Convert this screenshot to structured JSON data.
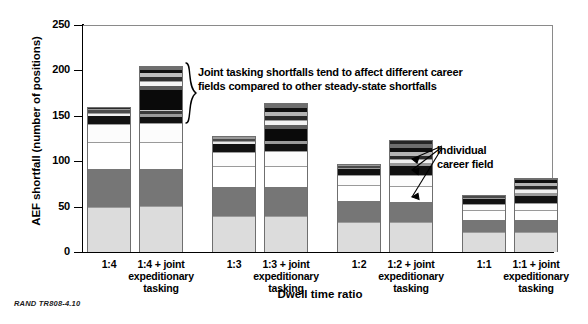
{
  "figure": {
    "footnote": "RAND TR808-4.10",
    "y_axis_title": "AEF shortfall (number of positions)",
    "x_axis_title": "Dwell time ratio"
  },
  "annotations": [
    {
      "name": "joint-tasking-note",
      "line1": "Joint tasking shortfalls tend to affect different career",
      "line2": "fields compared to other steady-state shortfalls"
    },
    {
      "name": "individual-career-field-note",
      "line1": "Individual",
      "line2": "career field"
    }
  ],
  "chart_data": {
    "type": "bar",
    "subtype": "stacked",
    "title": "",
    "xlabel": "Dwell time ratio",
    "ylabel": "AEF shortfall (number of positions)",
    "ylim": [
      0,
      250
    ],
    "yticks": [
      0,
      50,
      100,
      150,
      200,
      250
    ],
    "grid": false,
    "legend": "none",
    "categories": [
      "1:4",
      "1:4 + joint expeditionary tasking",
      "1:3",
      "1:3 + joint expeditionary tasking",
      "1:2",
      "1:2 + joint expeditionary tasking",
      "1:1",
      "1:1 + joint expeditionary tasking"
    ],
    "totals": [
      160,
      205,
      128,
      164,
      97,
      123,
      63,
      82
    ],
    "stacks": [
      {
        "category": "1:4",
        "total": 160,
        "segments": [
          {
            "value": 50,
            "color": "#dcdcdc"
          },
          {
            "value": 41,
            "color": "#767676"
          },
          {
            "value": 30,
            "color": "#ffffff"
          },
          {
            "value": 20,
            "color": "#fcfcfc"
          },
          {
            "value": 9,
            "color": "#111111"
          },
          {
            "value": 3,
            "color": "#f0f0f0"
          },
          {
            "value": 3,
            "color": "#4a4a4a"
          },
          {
            "value": 2,
            "color": "#9a9a9a"
          },
          {
            "value": 2,
            "color": "#2b2b2b"
          }
        ]
      },
      {
        "category": "1:4 + joint expeditionary tasking",
        "total": 205,
        "segments": [
          {
            "value": 51,
            "color": "#dcdcdc"
          },
          {
            "value": 40,
            "color": "#767676"
          },
          {
            "value": 30,
            "color": "#ffffff"
          },
          {
            "value": 21,
            "color": "#fcfcfc"
          },
          {
            "value": 7,
            "color": "#111111"
          },
          {
            "value": 3,
            "color": "#9a9a9a"
          },
          {
            "value": 3,
            "color": "#3a3a3a"
          },
          {
            "value": 2,
            "color": "#c8c8c8"
          },
          {
            "value": 22,
            "color": "#0a0a0a"
          },
          {
            "value": 4,
            "color": "#5a5a5a"
          },
          {
            "value": 5,
            "color": "#f4f4f4"
          },
          {
            "value": 5,
            "color": "#2f2f2f"
          },
          {
            "value": 4,
            "color": "#bdbdbd"
          },
          {
            "value": 4,
            "color": "#101010"
          },
          {
            "value": 4,
            "color": "#6e6e6e"
          }
        ]
      },
      {
        "category": "1:3",
        "total": 128,
        "segments": [
          {
            "value": 40,
            "color": "#dcdcdc"
          },
          {
            "value": 32,
            "color": "#767676"
          },
          {
            "value": 23,
            "color": "#ffffff"
          },
          {
            "value": 15,
            "color": "#fcfcfc"
          },
          {
            "value": 9,
            "color": "#111111"
          },
          {
            "value": 3,
            "color": "#e8e8e8"
          },
          {
            "value": 3,
            "color": "#4a4a4a"
          },
          {
            "value": 3,
            "color": "#9a9a9a"
          }
        ]
      },
      {
        "category": "1:3 + joint expeditionary tasking",
        "total": 164,
        "segments": [
          {
            "value": 40,
            "color": "#dcdcdc"
          },
          {
            "value": 32,
            "color": "#767676"
          },
          {
            "value": 23,
            "color": "#ffffff"
          },
          {
            "value": 16,
            "color": "#fcfcfc"
          },
          {
            "value": 8,
            "color": "#111111"
          },
          {
            "value": 3,
            "color": "#9a9a9a"
          },
          {
            "value": 14,
            "color": "#0a0a0a"
          },
          {
            "value": 4,
            "color": "#5f5f5f"
          },
          {
            "value": 5,
            "color": "#f2f2f2"
          },
          {
            "value": 5,
            "color": "#2b2b2b"
          },
          {
            "value": 4,
            "color": "#b5b5b5"
          },
          {
            "value": 5,
            "color": "#101010"
          },
          {
            "value": 5,
            "color": "#6e6e6e"
          }
        ]
      },
      {
        "category": "1:2",
        "total": 97,
        "segments": [
          {
            "value": 33,
            "color": "#dcdcdc"
          },
          {
            "value": 23,
            "color": "#767676"
          },
          {
            "value": 18,
            "color": "#ffffff"
          },
          {
            "value": 11,
            "color": "#fcfcfc"
          },
          {
            "value": 6,
            "color": "#111111"
          },
          {
            "value": 2,
            "color": "#e2e2e2"
          },
          {
            "value": 2,
            "color": "#4a4a4a"
          },
          {
            "value": 2,
            "color": "#9a9a9a"
          }
        ]
      },
      {
        "category": "1:2 + joint expeditionary tasking",
        "total": 123,
        "segments": [
          {
            "value": 33,
            "color": "#dcdcdc"
          },
          {
            "value": 22,
            "color": "#767676"
          },
          {
            "value": 18,
            "color": "#ffffff"
          },
          {
            "value": 12,
            "color": "#fcfcfc"
          },
          {
            "value": 10,
            "color": "#111111"
          },
          {
            "value": 3,
            "color": "#9a9a9a"
          },
          {
            "value": 4,
            "color": "#efefef"
          },
          {
            "value": 4,
            "color": "#2b2b2b"
          },
          {
            "value": 4,
            "color": "#b5b5b5"
          },
          {
            "value": 5,
            "color": "#101010"
          },
          {
            "value": 4,
            "color": "#6e6e6e"
          },
          {
            "value": 4,
            "color": "#262626"
          }
        ]
      },
      {
        "category": "1:1",
        "total": 63,
        "segments": [
          {
            "value": 22,
            "color": "#dcdcdc"
          },
          {
            "value": 13,
            "color": "#767676"
          },
          {
            "value": 11,
            "color": "#ffffff"
          },
          {
            "value": 7,
            "color": "#fcfcfc"
          },
          {
            "value": 5,
            "color": "#111111"
          },
          {
            "value": 2,
            "color": "#d8d8d8"
          },
          {
            "value": 2,
            "color": "#4a4a4a"
          },
          {
            "value": 1,
            "color": "#9a9a9a"
          }
        ]
      },
      {
        "category": "1:1 + joint expeditionary tasking",
        "total": 82,
        "segments": [
          {
            "value": 22,
            "color": "#dcdcdc"
          },
          {
            "value": 13,
            "color": "#767676"
          },
          {
            "value": 11,
            "color": "#ffffff"
          },
          {
            "value": 8,
            "color": "#fcfcfc"
          },
          {
            "value": 8,
            "color": "#111111"
          },
          {
            "value": 3,
            "color": "#9a9a9a"
          },
          {
            "value": 4,
            "color": "#f0f0f0"
          },
          {
            "value": 4,
            "color": "#2b2b2b"
          },
          {
            "value": 3,
            "color": "#b5b5b5"
          },
          {
            "value": 3,
            "color": "#101010"
          },
          {
            "value": 3,
            "color": "#6e6e6e"
          }
        ]
      }
    ]
  }
}
